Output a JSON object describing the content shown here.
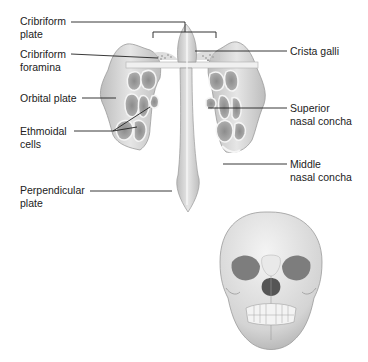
{
  "figure": {
    "labels": {
      "cribriform_plate": [
        "Cribriform",
        "plate"
      ],
      "cribriform_foramina": [
        "Cribriform",
        "foramina"
      ],
      "orbital_plate": [
        "Orbital plate"
      ],
      "ethmoidal_cells": [
        "Ethmoidal",
        "cells"
      ],
      "perpendicular_plate": [
        "Perpendicular",
        "plate"
      ],
      "crista_galli": [
        "Crista galli"
      ],
      "superior_nasal_concha": [
        "Superior",
        "nasal concha"
      ],
      "middle_nasal_concha": [
        "Middle",
        "nasal concha"
      ]
    },
    "colors": {
      "bone": "#d9d9d9",
      "bone_dark": "#a6a6a6",
      "bone_light": "#f2f2f2",
      "leader_line": "#222222",
      "text": "#222222"
    }
  }
}
